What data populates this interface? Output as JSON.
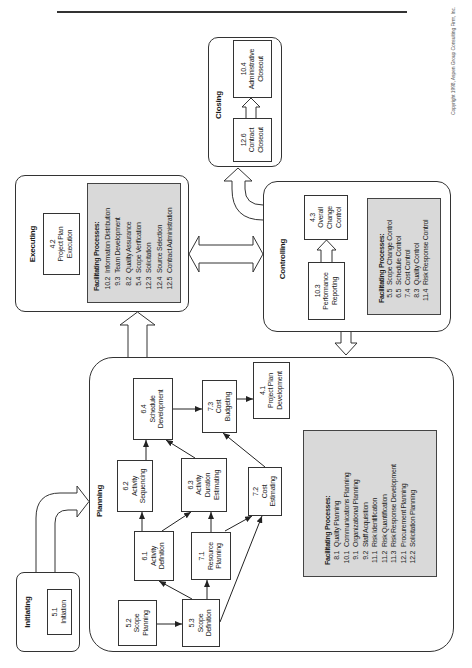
{
  "copyright": "Copyright 1998, Aspen Group Consulting Firm, Inc.",
  "colors": {
    "line": "#333333",
    "facilitating_fill": "#d9d9d9",
    "background": "#ffffff"
  },
  "initiating": {
    "label": "Initiating",
    "processes": [
      {
        "id": "5.1",
        "name": "Initiation"
      }
    ]
  },
  "planning": {
    "label": "Planning",
    "processes": [
      {
        "id": "5.2",
        "name": "Scope\nPlanning"
      },
      {
        "id": "5.3",
        "name": "Scope\nDefinition"
      },
      {
        "id": "6.1",
        "name": "Activity\nDefinition"
      },
      {
        "id": "7.1",
        "name": "Resource\nPlanning"
      },
      {
        "id": "6.2",
        "name": "Activity\nSequencing"
      },
      {
        "id": "6.3",
        "name": "Activity\nDuration\nEstimating"
      },
      {
        "id": "7.2",
        "name": "Cost\nEstimating"
      },
      {
        "id": "6.4",
        "name": "Schedule\nDevelopment"
      },
      {
        "id": "7.3",
        "name": "Cost\nBudgeting"
      },
      {
        "id": "4.1",
        "name": "Project Plan\nDevelopment"
      }
    ],
    "facilitating": {
      "title": "Facilitating Processes:",
      "items": [
        {
          "num": "8.1",
          "name": "Quality Planning"
        },
        {
          "num": "10.1",
          "name": "Communications Planning"
        },
        {
          "num": "9.1",
          "name": "Organizational Planning"
        },
        {
          "num": "9.2",
          "name": "Staff Acquisition"
        },
        {
          "num": "11.1",
          "name": "Risk Identification"
        },
        {
          "num": "11.2",
          "name": "Risk Quantification"
        },
        {
          "num": "11.3",
          "name": "Risk Response Development"
        },
        {
          "num": "12.1",
          "name": "Procurement Planning"
        },
        {
          "num": "12.2",
          "name": "Solicitation Planning"
        }
      ]
    }
  },
  "executing": {
    "label": "Executing",
    "processes": [
      {
        "id": "4.2",
        "name": "Project Plan\nExecution"
      }
    ],
    "facilitating": {
      "title": "Facilitating Processes:",
      "items": [
        {
          "num": "10.2",
          "name": "Information Distribution"
        },
        {
          "num": "9.3",
          "name": "Team Development"
        },
        {
          "num": "8.2",
          "name": "Quality Assurance"
        },
        {
          "num": "5.4",
          "name": "Scope Verification"
        },
        {
          "num": "12.3",
          "name": "Solicitation"
        },
        {
          "num": "12.4",
          "name": "Source Selection"
        },
        {
          "num": "12.5",
          "name": "Contract Administration"
        }
      ]
    }
  },
  "controlling": {
    "label": "Controlling",
    "processes": [
      {
        "id": "4.3",
        "name": "Overall\nChange\nControl"
      },
      {
        "id": "10.3",
        "name": "Performance\nReporting"
      }
    ],
    "facilitating": {
      "title": "Facilitating Processes:",
      "items": [
        {
          "num": "5.5",
          "name": "Scope Change Control"
        },
        {
          "num": "6.5",
          "name": "Schedule Control"
        },
        {
          "num": "7.4",
          "name": "Cost Control"
        },
        {
          "num": "8.3",
          "name": "Quality Control"
        },
        {
          "num": "11.4",
          "name": "Risk Response Control"
        }
      ]
    }
  },
  "closing": {
    "label": "Closing",
    "processes": [
      {
        "id": "12.6",
        "name": "Contract\nCloseout"
      },
      {
        "id": "10.4",
        "name": "Administrative\nCloseout"
      }
    ]
  },
  "links": [
    {
      "from": "Initiating",
      "to": "Planning"
    },
    {
      "from": "Planning",
      "to": "Executing"
    },
    {
      "from": "Executing",
      "to": "Controlling",
      "bidirectional": true
    },
    {
      "from": "Controlling",
      "to": "Planning"
    },
    {
      "from": "Controlling",
      "to": "Closing"
    },
    {
      "from": "5.2",
      "to": "5.3"
    },
    {
      "from": "5.3",
      "to": "6.1"
    },
    {
      "from": "5.3",
      "to": "7.1"
    },
    {
      "from": "5.3",
      "to": "7.2"
    },
    {
      "from": "6.1",
      "to": "6.2"
    },
    {
      "from": "6.1",
      "to": "6.3"
    },
    {
      "from": "7.1",
      "to": "6.3"
    },
    {
      "from": "7.1",
      "to": "7.2"
    },
    {
      "from": "6.2",
      "to": "6.4"
    },
    {
      "from": "6.3",
      "to": "6.4"
    },
    {
      "from": "7.2",
      "to": "7.3"
    },
    {
      "from": "6.4",
      "to": "7.3"
    },
    {
      "from": "7.3",
      "to": "4.1"
    },
    {
      "from": "10.3",
      "to": "4.3"
    },
    {
      "from": "12.6",
      "to": "10.4"
    }
  ]
}
